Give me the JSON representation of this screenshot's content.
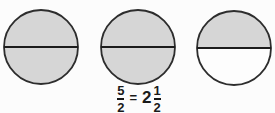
{
  "figure": {
    "background_color": "#fcfcfc",
    "shaded_fill": "#d6d6d6",
    "unshaded_fill": "#fdfdfd",
    "outline_color": "#2d2d2d",
    "divider_color": "#1c1c1c",
    "circles": [
      {
        "label": "circle-1",
        "top_shaded": true,
        "bottom_shaded": true,
        "top_fill": "#d6d6d6",
        "bottom_fill": "#d6d6d6"
      },
      {
        "label": "circle-2",
        "top_shaded": true,
        "bottom_shaded": true,
        "top_fill": "#d6d6d6",
        "bottom_fill": "#d6d6d6"
      },
      {
        "label": "circle-3",
        "top_shaded": true,
        "bottom_shaded": false,
        "top_fill": "#d6d6d6",
        "bottom_fill": "#fdfdfd"
      }
    ],
    "equation": {
      "lhs_numerator": "5",
      "lhs_denominator": "2",
      "equals": "=",
      "whole_number": "2",
      "rhs_numerator": "1",
      "rhs_denominator": "2"
    }
  }
}
